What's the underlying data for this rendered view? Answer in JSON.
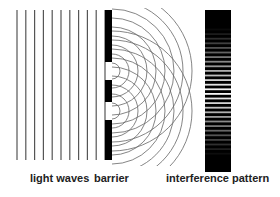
{
  "diagram": {
    "labels": {
      "light_waves": "light waves",
      "barrier": "barrier",
      "interference_pattern": "interference pattern"
    },
    "colors": {
      "line": "#555555",
      "barrier": "#000000",
      "arc": "#666666",
      "pattern_dark": "#000000",
      "pattern_light": "#ffffff"
    },
    "wave_lines": {
      "count": 11,
      "x_start": 17,
      "spacing": 8.8,
      "y_top": 10,
      "y_bottom": 160
    },
    "barrier": {
      "x": 105,
      "width": 7,
      "segments": [
        {
          "y": 10,
          "h": 52
        },
        {
          "y": 80,
          "h": 22
        },
        {
          "y": 120,
          "h": 40
        }
      ],
      "slits": [
        71,
        111
      ]
    },
    "arcs": {
      "count": 9,
      "start_radius": 8,
      "step": 9
    },
    "pattern": {
      "x": 205,
      "width": 26,
      "y_top": 10,
      "y_bottom": 172
    }
  }
}
